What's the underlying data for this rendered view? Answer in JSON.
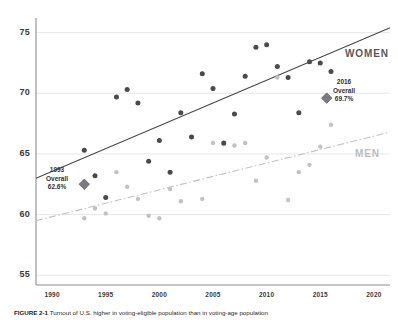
{
  "chart_data": {
    "type": "scatter",
    "title": "",
    "xlabel": "",
    "ylabel": "",
    "xlim": [
      1988.5,
      2021.5
    ],
    "ylim": [
      54.2,
      76.2
    ],
    "grid": true,
    "xticks": [
      1990,
      1995,
      2000,
      2005,
      2010,
      2015,
      2020
    ],
    "yticks": [
      55,
      60,
      65,
      70,
      75
    ],
    "legend_position": "inline-right",
    "series": [
      {
        "name": "WOMEN",
        "color": "#4a4a4d",
        "marker": "circle",
        "points": [
          [
            1993,
            65.3
          ],
          [
            1994,
            63.2
          ],
          [
            1995,
            61.4
          ],
          [
            1996,
            69.7
          ],
          [
            1997,
            70.3
          ],
          [
            1998,
            69.2
          ],
          [
            1999,
            64.4
          ],
          [
            2000,
            66.1
          ],
          [
            2001,
            63.5
          ],
          [
            2002,
            68.4
          ],
          [
            2003,
            66.4
          ],
          [
            2004,
            71.6
          ],
          [
            2005,
            70.4
          ],
          [
            2006,
            65.9
          ],
          [
            2007,
            68.3
          ],
          [
            2008,
            71.4
          ],
          [
            2009,
            73.8
          ],
          [
            2010,
            74.0
          ],
          [
            2011,
            72.2
          ],
          [
            2012,
            71.3
          ],
          [
            2013,
            68.4
          ],
          [
            2014,
            72.6
          ],
          [
            2015,
            72.5
          ],
          [
            2016,
            71.8
          ]
        ],
        "trendline": {
          "style": "solid",
          "color": "#4a4a4d",
          "x_start": 1988.5,
          "y_start": 63.0,
          "x_end": 2021.5,
          "y_end": 75.4
        }
      },
      {
        "name": "MEN",
        "color": "#c2c2c2",
        "marker": "circle",
        "points": [
          [
            1993,
            59.7
          ],
          [
            1994,
            60.5
          ],
          [
            1995,
            60.1
          ],
          [
            1996,
            63.5
          ],
          [
            1997,
            62.3
          ],
          [
            1998,
            61.3
          ],
          [
            1999,
            59.9
          ],
          [
            2000,
            59.7
          ],
          [
            2001,
            62.1
          ],
          [
            2002,
            61.1
          ],
          [
            2003,
            66.4
          ],
          [
            2004,
            61.3
          ],
          [
            2005,
            65.9
          ],
          [
            2006,
            65.8
          ],
          [
            2007,
            65.7
          ],
          [
            2008,
            65.9
          ],
          [
            2009,
            62.8
          ],
          [
            2010,
            64.7
          ],
          [
            2011,
            71.3
          ],
          [
            2012,
            61.2
          ],
          [
            2013,
            63.5
          ],
          [
            2014,
            64.1
          ],
          [
            2015,
            65.6
          ],
          [
            2016,
            67.4
          ]
        ],
        "trendline": {
          "style": "dash-dot",
          "color": "#c2c2c2",
          "x_start": 1988.5,
          "y_start": 59.5,
          "x_end": 2021.5,
          "y_end": 66.8
        }
      }
    ],
    "annotations": [
      {
        "name": "overall-1993",
        "marker": "diamond",
        "color": "#7b7b80",
        "x": 1993,
        "y": 62.5,
        "line1": "1993",
        "line2": "Overall",
        "line3": "62.6%"
      },
      {
        "name": "overall-2016",
        "marker": "diamond",
        "color": "#7b7b80",
        "x": 2015.6,
        "y": 69.6,
        "line1": "2016",
        "line2": "Overall",
        "line3": "69.7%"
      }
    ],
    "series_labels": [
      {
        "text": "WOMEN",
        "color": "#58585a"
      },
      {
        "text": "MEN",
        "color": "#bdbdbd"
      }
    ]
  },
  "axis": {
    "y_tick_labels": [
      "75",
      "70",
      "65",
      "60",
      "55"
    ],
    "x_tick_labels": [
      "1990",
      "1995",
      "2000",
      "2005",
      "2010",
      "2015",
      "2020"
    ]
  },
  "labels": {
    "women": "WOMEN",
    "men": "MEN"
  },
  "callouts": {
    "c1993": {
      "year": "1993",
      "word": "Overall",
      "value": "62.6%"
    },
    "c2016": {
      "year": "2016",
      "word": "Overall",
      "value": "69.7%"
    }
  },
  "caption": {
    "figure_number": "FIGURE 2-1",
    "text": "Turnout of U.S. higher in voting-eligible population than in voting-age population"
  }
}
